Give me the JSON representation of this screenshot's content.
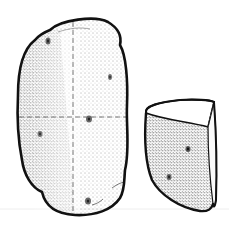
{
  "illustration": {
    "subject": "potato with cut wedge",
    "colors": {
      "background": "#ffffff",
      "outline": "#111111",
      "stipple": "#333333",
      "guide_line": "#555555",
      "ground_line": "#eeeeee"
    },
    "parts": [
      {
        "name": "whole-potato",
        "eyes": 5,
        "guide_lines": "dashed cross"
      },
      {
        "name": "potato-wedge",
        "eyes": 2
      }
    ]
  }
}
